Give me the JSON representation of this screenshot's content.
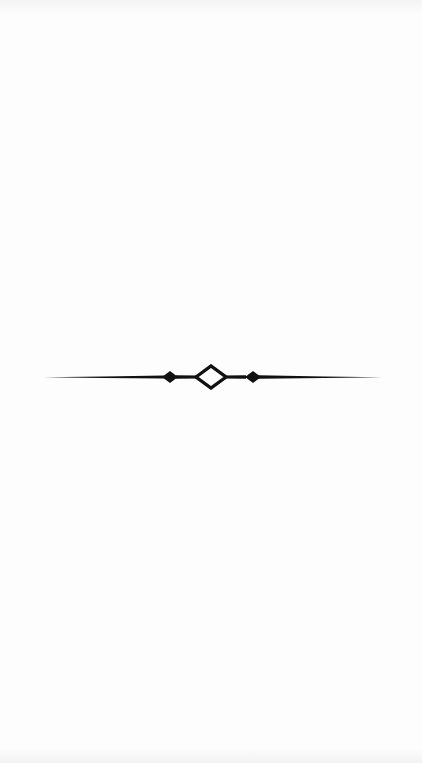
{
  "page": {
    "type": "blank-page-with-ornament",
    "background_color": "#fdfdfd"
  },
  "ornament": {
    "icon": "ornamental-divider-icon",
    "color": "#111111",
    "elements": [
      "tapered-rule-left",
      "solid-diamond-left",
      "hollow-diamond-center",
      "solid-diamond-right",
      "tapered-rule-right"
    ]
  }
}
